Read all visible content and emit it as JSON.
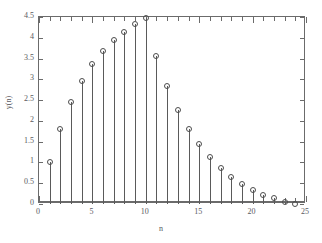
{
  "chart_data": {
    "type": "line",
    "plot_style": "stem",
    "title": "",
    "xlabel": "n",
    "ylabel": "y(n)",
    "xlim": [
      0,
      25
    ],
    "ylim": [
      0,
      4.5
    ],
    "grid": false,
    "legend": null,
    "marker": "open-circle",
    "xticks": [
      0,
      5,
      10,
      15,
      20,
      25
    ],
    "xtick_labels": [
      "0",
      "5",
      "10",
      "15",
      "20",
      "25"
    ],
    "xminor_ticks": [
      1,
      2,
      3,
      4,
      6,
      7,
      8,
      9,
      11,
      12,
      13,
      14,
      16,
      17,
      18,
      19,
      21,
      22,
      23,
      24
    ],
    "yticks": [
      0,
      0.5,
      1,
      1.5,
      2,
      2.5,
      3,
      3.5,
      4,
      4.5
    ],
    "ytick_labels": [
      "0",
      "0.5",
      "1",
      "1.5",
      "2",
      "2.5",
      "3",
      "3.5",
      "4",
      "4.5"
    ],
    "x": [
      1,
      2,
      3,
      4,
      5,
      6,
      7,
      8,
      9,
      10,
      11,
      12,
      13,
      14,
      15,
      16,
      17,
      18,
      19,
      20,
      21,
      22,
      23,
      24
    ],
    "values": [
      1.0,
      1.81,
      2.45,
      2.95,
      3.36,
      3.68,
      3.94,
      4.14,
      4.32,
      4.47,
      3.56,
      2.84,
      2.27,
      1.81,
      1.45,
      1.12,
      0.86,
      0.64,
      0.47,
      0.33,
      0.22,
      0.14,
      0.05,
      0.0
    ],
    "series_name": "y(n)",
    "colors": {
      "stem": "#5a5a5a",
      "marker_edge": "#4d4d4d",
      "axis": "#6b6b6b",
      "text": "#59595e",
      "background": "#ffffff"
    }
  }
}
